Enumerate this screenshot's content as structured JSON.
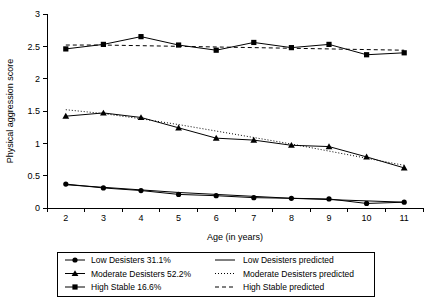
{
  "chart_data": {
    "type": "line",
    "title": "",
    "xlabel": "Age (in years)",
    "ylabel": "Physical aggression score",
    "x": [
      2,
      3,
      4,
      5,
      6,
      7,
      8,
      9,
      10,
      11
    ],
    "xlim": [
      1.5,
      11.5
    ],
    "ylim": [
      0,
      3
    ],
    "yticks": [
      0,
      0.5,
      1,
      1.5,
      2,
      2.5,
      3
    ],
    "ytick_labels": [
      "0",
      "0.5",
      "1",
      "1.5",
      "2",
      "2.5",
      "3"
    ],
    "xtick_labels": [
      "2",
      "3",
      "4",
      "5",
      "6",
      "7",
      "8",
      "9",
      "10",
      "11"
    ],
    "grid": false,
    "legend_position": "below-plot",
    "series": [
      {
        "name": "Low Desisters 31.1%",
        "key": "low_desisters",
        "marker": "circle",
        "line_style": "solid",
        "values": [
          0.37,
          0.31,
          0.27,
          0.21,
          0.19,
          0.16,
          0.15,
          0.14,
          0.07,
          0.09
        ]
      },
      {
        "name": "Moderate Desisters 52.2%",
        "key": "moderate_desisters",
        "marker": "triangle",
        "line_style": "solid",
        "values": [
          1.42,
          1.47,
          1.4,
          1.24,
          1.08,
          1.05,
          0.97,
          0.95,
          0.79,
          0.62
        ]
      },
      {
        "name": "High Stable 16.6%",
        "key": "high_stable",
        "marker": "square",
        "line_style": "solid",
        "values": [
          2.46,
          2.53,
          2.65,
          2.52,
          2.44,
          2.56,
          2.48,
          2.53,
          2.37,
          2.4
        ]
      },
      {
        "name": "Low Desisters predicted",
        "key": "low_desisters_predicted",
        "marker": "none",
        "line_style": "solid",
        "values": [
          0.36,
          0.32,
          0.28,
          0.24,
          0.21,
          0.18,
          0.15,
          0.13,
          0.11,
          0.09
        ]
      },
      {
        "name": "Moderate Desisters predicted",
        "key": "moderate_desisters_predicted",
        "marker": "none",
        "line_style": "dotted",
        "values": [
          1.52,
          1.46,
          1.38,
          1.29,
          1.19,
          1.09,
          0.99,
          0.88,
          0.77,
          0.66
        ]
      },
      {
        "name": "High Stable predicted",
        "key": "high_stable_predicted",
        "marker": "none",
        "line_style": "dashed",
        "values": [
          2.52,
          2.52,
          2.51,
          2.5,
          2.49,
          2.48,
          2.47,
          2.46,
          2.45,
          2.44
        ]
      }
    ]
  },
  "legend": {
    "entries": [
      {
        "label": "Low Desisters 31.1%",
        "marker": "circle",
        "line_style": "solid"
      },
      {
        "label": "Moderate Desisters 52.2%",
        "marker": "triangle",
        "line_style": "solid"
      },
      {
        "label": "High Stable 16.6%",
        "marker": "square",
        "line_style": "solid"
      },
      {
        "label": "Low Desisters predicted",
        "marker": "none",
        "line_style": "solid"
      },
      {
        "label": "Moderate Desisters predicted",
        "marker": "none",
        "line_style": "dotted"
      },
      {
        "label": "High Stable predicted",
        "marker": "none",
        "line_style": "dashed"
      }
    ]
  },
  "colors": {
    "ink": "#000000",
    "background": "#ffffff"
  }
}
